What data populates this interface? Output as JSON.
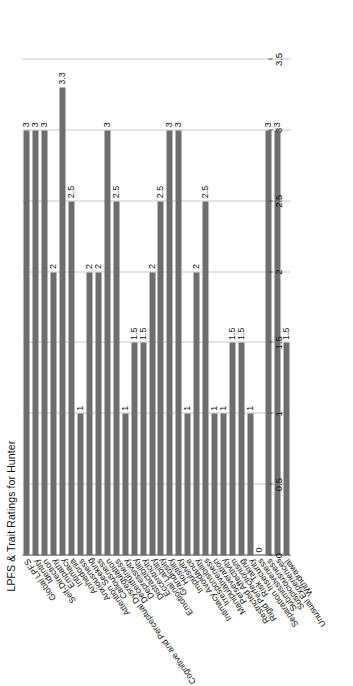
{
  "chart_data": {
    "type": "bar",
    "orientation": "horizontal",
    "title": "LPFS & Trait Ratings for Hunter",
    "xlabel": "",
    "ylabel": "",
    "xlim": [
      0,
      3.5
    ],
    "xticks": [
      "0",
      "0.5",
      "1",
      "1.5",
      "2",
      "2.5",
      "3",
      "3.5"
    ],
    "xtick_values": [
      0,
      0.5,
      1,
      1.5,
      2,
      2.5,
      3,
      3.5
    ],
    "grid": true,
    "legend": "none",
    "bar_color": "#6e6e6e",
    "categories": [
      "Global LPFS",
      "Identity",
      "Self-Direction",
      "Empathy",
      "Intimacy",
      "Anhedonia",
      "Anxiousness",
      "Attention Seeking",
      "Callousness",
      "Cognitive and Perceptual Dysregulation",
      "Deceitfulness",
      "Depressivity",
      "Distractibility",
      "Eccentricity",
      "Emotional Lability",
      "Grandiosity",
      "Hostility",
      "Impulsivity",
      "Intimacy Avoidance",
      "Irresponsibility",
      "Manipulativeness",
      "Perseveration",
      "Restricted Affectivity",
      "Rigid Perfectionism",
      "Risk Taking",
      "Separation Insecurity",
      "Submissiveness",
      "Suspiciousness",
      "Unusual Experiences",
      "Withdrawal"
    ],
    "values": [
      3,
      3,
      3,
      2,
      3.3,
      2.5,
      1,
      2,
      2,
      3,
      2.5,
      1,
      1.5,
      1.5,
      2,
      2.5,
      3,
      3,
      1,
      2,
      2.5,
      1,
      1,
      1.5,
      1.5,
      1,
      0,
      3,
      3,
      1.5
    ],
    "value_labels": [
      "3",
      "3",
      "3",
      "2",
      "3.3",
      "2.5",
      "1",
      "2",
      "2",
      "3",
      "2.5",
      "1",
      "1.5",
      "1.5",
      "2",
      "2.5",
      "3",
      "3",
      "1",
      "2",
      "2.5",
      "1",
      "1",
      "1.5",
      "1.5",
      "1",
      "0",
      "3",
      "3",
      "1.5"
    ]
  }
}
